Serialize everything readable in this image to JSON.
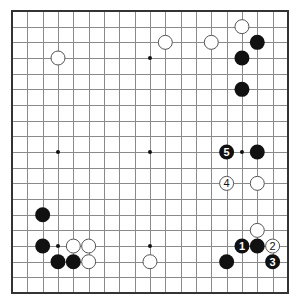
{
  "board": {
    "size": 19,
    "origin": {
      "x": 12,
      "y": 11
    },
    "spacing": {
      "x": 15.33,
      "y": 15.67
    },
    "stone_radius": 7.5,
    "star_points": [
      [
        3,
        3
      ],
      [
        9,
        3
      ],
      [
        15,
        3
      ],
      [
        3,
        9
      ],
      [
        9,
        9
      ],
      [
        15,
        9
      ],
      [
        3,
        15
      ],
      [
        9,
        15
      ],
      [
        15,
        15
      ]
    ],
    "colors": {
      "background": "#ffffff",
      "lines": "#8a8a8a",
      "border": "#333333",
      "black": "#111111",
      "white": "#ffffff"
    }
  },
  "stones": [
    {
      "color": "white",
      "col": 3,
      "row": 3,
      "label": ""
    },
    {
      "color": "white",
      "col": 10,
      "row": 2,
      "label": ""
    },
    {
      "color": "white",
      "col": 13,
      "row": 2,
      "label": ""
    },
    {
      "color": "white",
      "col": 15,
      "row": 1,
      "label": ""
    },
    {
      "color": "black",
      "col": 16,
      "row": 2,
      "label": ""
    },
    {
      "color": "black",
      "col": 15,
      "row": 3,
      "label": ""
    },
    {
      "color": "black",
      "col": 15,
      "row": 5,
      "label": ""
    },
    {
      "color": "black",
      "col": 14,
      "row": 9,
      "label": "5"
    },
    {
      "color": "black",
      "col": 16,
      "row": 9,
      "label": ""
    },
    {
      "color": "white",
      "col": 14,
      "row": 11,
      "label": "4"
    },
    {
      "color": "white",
      "col": 16,
      "row": 11,
      "label": ""
    },
    {
      "color": "white",
      "col": 16,
      "row": 14,
      "label": ""
    },
    {
      "color": "black",
      "col": 15,
      "row": 15,
      "label": "1"
    },
    {
      "color": "black",
      "col": 16,
      "row": 15,
      "label": ""
    },
    {
      "color": "white",
      "col": 17,
      "row": 15,
      "label": "2"
    },
    {
      "color": "black",
      "col": 17,
      "row": 16,
      "label": "3"
    },
    {
      "color": "black",
      "col": 14,
      "row": 16,
      "label": ""
    },
    {
      "color": "white",
      "col": 9,
      "row": 16,
      "label": ""
    },
    {
      "color": "black",
      "col": 2,
      "row": 13,
      "label": ""
    },
    {
      "color": "black",
      "col": 2,
      "row": 15,
      "label": ""
    },
    {
      "color": "white",
      "col": 4,
      "row": 15,
      "label": ""
    },
    {
      "color": "white",
      "col": 5,
      "row": 15,
      "label": ""
    },
    {
      "color": "black",
      "col": 3,
      "row": 16,
      "label": ""
    },
    {
      "color": "black",
      "col": 4,
      "row": 16,
      "label": ""
    },
    {
      "color": "white",
      "col": 5,
      "row": 16,
      "label": ""
    }
  ]
}
